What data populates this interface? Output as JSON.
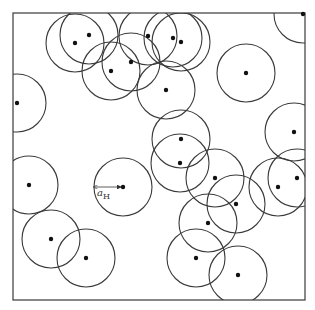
{
  "diagram": {
    "box": {
      "x": 13,
      "y": 13,
      "width": 292,
      "height": 287
    },
    "radius": 29,
    "line_color": "#3a3a3a",
    "dot_color": "#111111",
    "particles": [
      {
        "x": 303,
        "y": 14
      },
      {
        "x": 75,
        "y": 43
      },
      {
        "x": 89,
        "y": 35
      },
      {
        "x": 111,
        "y": 71
      },
      {
        "x": 131,
        "y": 62
      },
      {
        "x": 148,
        "y": 36
      },
      {
        "x": 173,
        "y": 38
      },
      {
        "x": 181,
        "y": 42
      },
      {
        "x": 166,
        "y": 90
      },
      {
        "x": 246,
        "y": 73
      },
      {
        "x": 17,
        "y": 103
      },
      {
        "x": 294,
        "y": 132
      },
      {
        "x": 181,
        "y": 139
      },
      {
        "x": 180,
        "y": 163
      },
      {
        "x": 215,
        "y": 178
      },
      {
        "x": 297,
        "y": 178
      },
      {
        "x": 278,
        "y": 187
      },
      {
        "x": 29,
        "y": 185
      },
      {
        "x": 123,
        "y": 187
      },
      {
        "x": 236,
        "y": 204
      },
      {
        "x": 208,
        "y": 223
      },
      {
        "x": 51,
        "y": 239
      },
      {
        "x": 196,
        "y": 258
      },
      {
        "x": 86,
        "y": 258
      },
      {
        "x": 238,
        "y": 275
      }
    ],
    "annotation": {
      "symbol": "a",
      "subscript": "H",
      "arrow_from": {
        "x": 94,
        "y": 187
      },
      "arrow_to": {
        "x": 121,
        "y": 187
      },
      "label_x": 97,
      "label_y": 196
    }
  }
}
